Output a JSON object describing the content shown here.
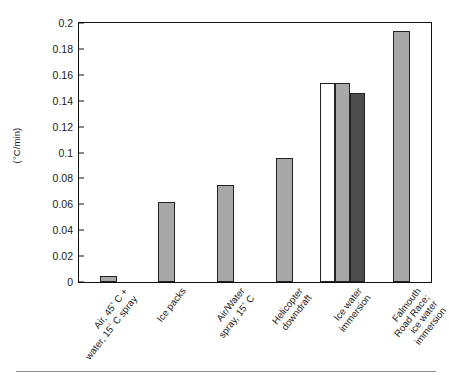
{
  "figure": {
    "background_color": "#ffffff",
    "frame_color": "#111111",
    "bottom_rule": true
  },
  "axes": {
    "y_title": "(°C/min)",
    "y_ticks": [
      "0",
      "0.02",
      "0.04",
      "0.06",
      "0.08",
      "0.1",
      "0.12",
      "0.14",
      "0.16",
      "0.18",
      "0.2"
    ]
  },
  "chart_data": {
    "type": "bar",
    "title": "",
    "xlabel": "",
    "ylabel": "(°C/min)",
    "ylim": [
      0,
      0.2
    ],
    "ytick_values": [
      0,
      0.02,
      0.04,
      0.06,
      0.08,
      0.1,
      0.12,
      0.14,
      0.16,
      0.18,
      0.2
    ],
    "grid": false,
    "legend": false,
    "categories": [
      "Air, 45° C + water, 15° C spray",
      "Ice packs",
      "Air/Water spray, 15° C",
      "Helicopter downdraft",
      "Ice water immersion",
      "Falmouth Road Race; ice water immersion"
    ],
    "bars": [
      {
        "category_index": 0,
        "value": 0.005,
        "fill": "#a8a8a8"
      },
      {
        "category_index": 1,
        "value": 0.062,
        "fill": "#a8a8a8"
      },
      {
        "category_index": 2,
        "value": 0.075,
        "fill": "#a8a8a8"
      },
      {
        "category_index": 3,
        "value": 0.096,
        "fill": "#a8a8a8"
      },
      {
        "category_index": 4,
        "value": 0.154,
        "fill": "#ffffff"
      },
      {
        "category_index": 4,
        "value": 0.154,
        "fill": "#a8a8a8"
      },
      {
        "category_index": 4,
        "value": 0.146,
        "fill": "#4d4d4d"
      },
      {
        "category_index": 5,
        "value": 0.194,
        "fill": "#a8a8a8"
      }
    ],
    "values": [
      0.005,
      0.062,
      0.075,
      0.096,
      0.154,
      0.194
    ]
  },
  "xlabels": [
    {
      "lines": [
        "Air, 45",
        "water, 15"
      ],
      "suffix": [
        " C +",
        " C spray"
      ],
      "full": "Air, 45° C + water, 15° C spray"
    },
    {
      "lines": [
        "Ice packs"
      ],
      "suffix": [
        ""
      ],
      "full": "Ice packs"
    },
    {
      "lines": [
        "Air/Water",
        "spray, 15"
      ],
      "suffix": [
        "",
        " C"
      ],
      "full": "Air/Water spray, 15° C"
    },
    {
      "lines": [
        "Helicopter",
        "downdraft"
      ],
      "suffix": [
        "",
        ""
      ],
      "full": "Helicopter downdraft"
    },
    {
      "lines": [
        "Ice water",
        "immersion"
      ],
      "suffix": [
        "",
        ""
      ],
      "full": "Ice water immersion"
    },
    {
      "lines": [
        "Falmouth",
        "Road Race;",
        "ice water",
        "immersion"
      ],
      "suffix": [
        "",
        "",
        "",
        ""
      ],
      "full": "Falmouth Road Race; ice water immersion"
    }
  ]
}
